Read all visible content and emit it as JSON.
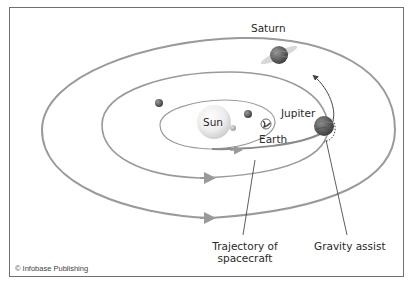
{
  "diagram": {
    "labels": {
      "sun": "Sun",
      "earth": "Earth",
      "jupiter": "Jupiter",
      "saturn": "Saturn",
      "trajectory_line1": "Trajectory of",
      "trajectory_line2": "spacecraft",
      "gravity_assist": "Gravity assist"
    },
    "credit": "© Infobase Publishing",
    "colors": {
      "orbit": "#9a9a9a",
      "trajectory": "#8a8a8a",
      "frame": "#707070",
      "sun": "#e6e6e6",
      "planet_dark": "#555555",
      "text": "#2a2a2a"
    },
    "bodies": [
      {
        "name": "Sun",
        "x": 214,
        "y": 122,
        "r": 17
      },
      {
        "name": "Mercury",
        "x": 233,
        "y": 128,
        "r": 3
      },
      {
        "name": "Venus",
        "x": 248,
        "y": 114,
        "r": 4
      },
      {
        "name": "Earth",
        "x": 266,
        "y": 124,
        "r": 5
      },
      {
        "name": "Mars",
        "x": 159,
        "y": 103,
        "r": 4
      },
      {
        "name": "Jupiter",
        "x": 324,
        "y": 126,
        "r": 10
      },
      {
        "name": "Saturn",
        "x": 279,
        "y": 55,
        "r": 9
      }
    ]
  }
}
